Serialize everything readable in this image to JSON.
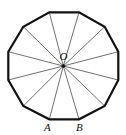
{
  "figure": {
    "shape": "regular dodecagon",
    "sides": 12,
    "center": {
      "label": "O",
      "x": 63.3,
      "y": 66
    },
    "vertices": [
      {
        "x": 49.3,
        "y": 12.3
      },
      {
        "x": 79,
        "y": 12.3
      },
      {
        "x": 104.7,
        "y": 26.7
      },
      {
        "x": 118.3,
        "y": 51.7
      },
      {
        "x": 118.3,
        "y": 80
      },
      {
        "x": 104.7,
        "y": 106
      },
      {
        "x": 79,
        "y": 119.3,
        "label": "B"
      },
      {
        "x": 49.3,
        "y": 119.3,
        "label": "A"
      },
      {
        "x": 23.3,
        "y": 106
      },
      {
        "x": 8.3,
        "y": 80
      },
      {
        "x": 8.3,
        "y": 51.7
      },
      {
        "x": 23.3,
        "y": 26.7
      }
    ],
    "labels": {
      "center": "O",
      "a": "A",
      "b": "B"
    },
    "colors": {
      "stroke": "#111111",
      "background": "#ffffff"
    }
  }
}
